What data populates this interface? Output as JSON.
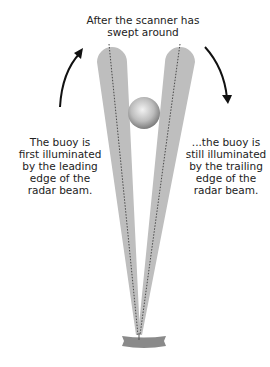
{
  "title": {
    "lines": [
      "After the scanner has",
      "swept around"
    ]
  },
  "left_caption": {
    "lines": [
      "The buoy is",
      "first illuminated",
      "by the leading",
      "edge of the",
      "radar beam."
    ]
  },
  "right_caption": {
    "lines": [
      "...the buoy is",
      "still illuminated",
      "by the trailing",
      "edge of the",
      "radar beam."
    ]
  },
  "icons": {
    "left_arrow": "curved-arrow-up-icon",
    "right_arrow": "curved-arrow-down-icon"
  },
  "colors": {
    "beam": "#bdbdbd",
    "centerline": "#555555",
    "arrow": "#111111",
    "antenna": "#8a8a8a",
    "buoy_light": "#e8e8e8",
    "buoy_dark": "#7a7a7a"
  }
}
